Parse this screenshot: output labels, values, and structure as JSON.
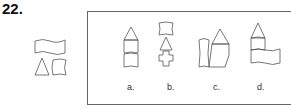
{
  "question": {
    "number": "22."
  },
  "options": [
    {
      "label": "a."
    },
    {
      "label": "b."
    },
    {
      "label": "c."
    },
    {
      "label": "d."
    }
  ]
}
